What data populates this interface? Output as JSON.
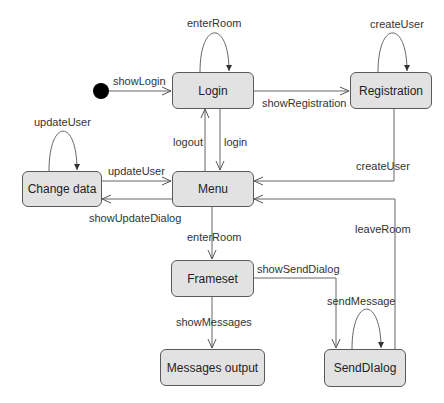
{
  "diagram": {
    "type": "UML state diagram",
    "initial_state": {
      "target": "Login"
    },
    "states": [
      {
        "id": "login",
        "label": "Login"
      },
      {
        "id": "registration",
        "label": "Registration"
      },
      {
        "id": "change_data",
        "label": "Change data"
      },
      {
        "id": "menu",
        "label": "Menu"
      },
      {
        "id": "frameset",
        "label": "Frameset"
      },
      {
        "id": "messages_output",
        "label": "Messages output"
      },
      {
        "id": "send_dialog",
        "label": "SendDIalog"
      }
    ],
    "transitions": [
      {
        "from": "initial",
        "to": "Login",
        "label": "showLogin"
      },
      {
        "from": "Login",
        "to": "Login",
        "label": "enterRoom"
      },
      {
        "from": "Login",
        "to": "Registration",
        "label": "showRegistration"
      },
      {
        "from": "Registration",
        "to": "Registration",
        "label": "createUser"
      },
      {
        "from": "Registration",
        "to": "Menu",
        "label": "createUser"
      },
      {
        "from": "Menu",
        "to": "Login",
        "label": "logout"
      },
      {
        "from": "Login",
        "to": "Menu",
        "label": "login"
      },
      {
        "from": "Change data",
        "to": "Change data",
        "label": "updateUser"
      },
      {
        "from": "Change data",
        "to": "Menu",
        "label": "updateUser"
      },
      {
        "from": "Menu",
        "to": "Change data",
        "label": "showUpdateDialog"
      },
      {
        "from": "Menu",
        "to": "Frameset",
        "label": "enterRoom"
      },
      {
        "from": "SendDIalog",
        "to": "Menu",
        "label": "leaveRoom"
      },
      {
        "from": "Frameset",
        "to": "SendDIalog",
        "label": "showSendDialog"
      },
      {
        "from": "SendDIalog",
        "to": "SendDIalog",
        "label": "sendMessage"
      },
      {
        "from": "Frameset",
        "to": "Messages output",
        "label": "showMessages"
      }
    ]
  },
  "labels": {
    "showLogin": "showLogin",
    "enterRoomLoop": "enterRoom",
    "showRegistration": "showRegistration",
    "createUserLoop": "createUser",
    "createUser": "createUser",
    "logout": "logout",
    "login": "login",
    "updateUserLoop": "updateUser",
    "updateUser": "updateUser",
    "showUpdateDialog": "showUpdateDialog",
    "enterRoom": "enterRoom",
    "leaveRoom": "leaveRoom",
    "showSendDialog": "showSendDialog",
    "sendMessage": "sendMessage",
    "showMessages": "showMessages"
  }
}
